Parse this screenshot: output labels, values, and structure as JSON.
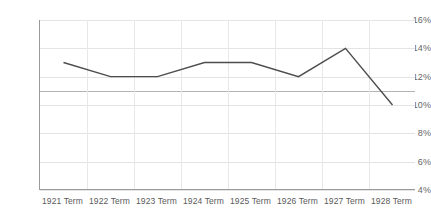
{
  "chart_data": {
    "type": "line",
    "title": "",
    "subtitle": "",
    "xlabel": "",
    "ylabel": "",
    "categories": [
      "1921 Term",
      "1922 Term",
      "1923 Term",
      "1924 Term",
      "1925 Term",
      "1926 Term",
      "1927 Term",
      "1928 Term"
    ],
    "series": [
      {
        "name": "",
        "values": [
          13.0,
          12.0,
          12.0,
          13.0,
          13.0,
          12.0,
          14.0,
          10.0
        ],
        "color": "#4d4d4d"
      }
    ],
    "ylim": [
      4,
      16
    ],
    "ytick_values": [
      4,
      6,
      8,
      10,
      12,
      14,
      16
    ],
    "ytick_labels": [
      "4%",
      "6%",
      "8%",
      "10%",
      "12%",
      "14%",
      "16%"
    ],
    "reference_line": {
      "value": 11,
      "color": "#b4b4b4"
    },
    "grid": {
      "horizontal": true,
      "vertical": true,
      "color": "#e4e4e4"
    },
    "legend": {
      "visible": false,
      "position": "none"
    },
    "axis": {
      "line_color": "#9a9a9a",
      "label_color": "#5a5a5a"
    },
    "background": "#ffffff"
  }
}
